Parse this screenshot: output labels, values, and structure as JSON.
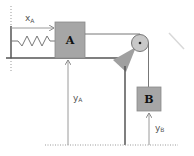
{
  "diagram": {
    "type": "mechanics-pulley-system",
    "blocks": [
      {
        "id": "A",
        "label": "A",
        "color": "#a6a6a6"
      },
      {
        "id": "B",
        "label": "B",
        "color": "#a6a6a6"
      }
    ],
    "labels": {
      "x_a": "x",
      "x_a_sub": "A",
      "y_a": "y",
      "y_a_sub": "A",
      "y_b": "y",
      "y_b_sub": "B"
    },
    "components": [
      "wall",
      "spring",
      "floor",
      "pulley",
      "pulley-support",
      "rope",
      "ground-datum"
    ],
    "colors": {
      "block_fill": "#a6a6a6",
      "line": "#6a6a6a",
      "arrow": "#9a9a9a",
      "pulley_fill": "#c8c8c8"
    }
  }
}
